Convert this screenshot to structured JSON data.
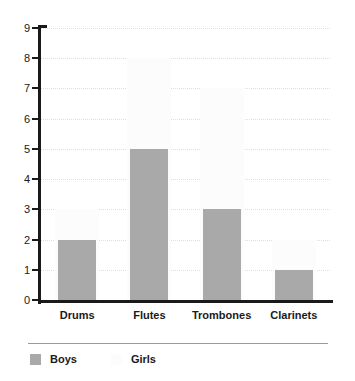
{
  "chart_data": {
    "type": "bar",
    "title": "",
    "subtitle": "",
    "xlabel": "",
    "ylabel": "",
    "categories": [
      "Drums",
      "Flutes",
      "Trombones",
      "Clarinets"
    ],
    "series": [
      {
        "name": "Boys",
        "values": [
          2,
          5,
          3,
          1
        ],
        "color": "#a9a9a9"
      },
      {
        "name": "Girls",
        "values": [
          3,
          8,
          7,
          2
        ],
        "color": "#fcfcfc"
      }
    ],
    "ylim": [
      0,
      9
    ],
    "ytick_labels": [
      "0",
      "1",
      "2",
      "3",
      "4",
      "5",
      "6",
      "7",
      "8",
      "9"
    ],
    "ytick_values": [
      0,
      1,
      2,
      3,
      4,
      5,
      6,
      7,
      8,
      9
    ],
    "grid": true,
    "grid_style": "dotted",
    "grid_color": "#dedede",
    "legend_position": "bottom-left",
    "axis_color": "#1a1a1a",
    "background_color": "#ffffff"
  },
  "legend": {
    "entries": [
      {
        "label": "Boys",
        "swatch_color": "#a9a9a9"
      },
      {
        "label": "Girls",
        "swatch_color": "#fcfcfc"
      }
    ]
  }
}
